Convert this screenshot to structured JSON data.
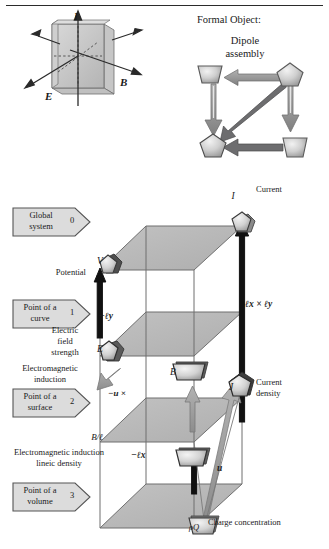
{
  "page": {
    "width": 329,
    "height": 549,
    "background": "#ffffff",
    "rule_color": "#2b2b2b"
  },
  "palette": {
    "plane_fill": "#b9b9b9",
    "plane_edge": "#6e6e6e",
    "node_light": "#d8d8d8",
    "node_mid": "#a8a8a8",
    "node_dark": "#3a3a3a",
    "arrow_gray": "#8f8f8f",
    "arrow_dark": "#58585a",
    "arrow_black": "#111111",
    "tag_fill": "#dcdcdc",
    "tag_edge": "#555555",
    "text": "#1a1a1a"
  },
  "top_left_figure": {
    "name": "em-slab-axes",
    "axis_labels": [
      {
        "id": "I",
        "text": "I",
        "role": "current-axis"
      },
      {
        "id": "E",
        "text": "E",
        "role": "electric-field-axis"
      },
      {
        "id": "B",
        "text": "B",
        "role": "magnetic-field-axis"
      }
    ]
  },
  "top_right_figure": {
    "heading": "Formal Object:",
    "title_line1": "Dipole",
    "title_line2": "assembly",
    "nodes": [
      {
        "id": "tl",
        "shape": "trapezoid",
        "label": ""
      },
      {
        "id": "tr",
        "shape": "pentagon",
        "label": ""
      },
      {
        "id": "bl",
        "shape": "pentagon",
        "label": ""
      },
      {
        "id": "br",
        "shape": "trapezoid",
        "label": ""
      }
    ],
    "arrows": [
      {
        "from": "tr",
        "to": "tl",
        "style": "thick-gray",
        "direction": "left"
      },
      {
        "from": "tl",
        "to": "bl",
        "style": "hollow-gray",
        "direction": "down"
      },
      {
        "from": "tr",
        "to": "br",
        "style": "hollow-gray",
        "direction": "down"
      },
      {
        "from": "tr",
        "to": "bl",
        "style": "thick-dark",
        "direction": "diagonal"
      },
      {
        "from": "br",
        "to": "bl",
        "style": "thick-dark",
        "direction": "left"
      }
    ]
  },
  "level_tags": [
    {
      "line1": "Global",
      "line2": "system",
      "number": "0"
    },
    {
      "line1": "Point of a",
      "line2": "curve",
      "number": "1"
    },
    {
      "line1": "Point of a",
      "line2": "surface",
      "number": "2"
    },
    {
      "line1": "Point of a",
      "line2": "volume",
      "number": "3"
    }
  ],
  "left_captions": [
    {
      "id": "potential",
      "lines": [
        "Potential"
      ]
    },
    {
      "id": "efield",
      "lines": [
        "Electric",
        "field",
        "strength"
      ]
    },
    {
      "id": "eminduction",
      "lines": [
        "Electromagnetic",
        "induction"
      ]
    },
    {
      "id": "emlineic",
      "lines": [
        "Electromagnetic induction",
        "lineic density"
      ]
    }
  ],
  "right_captions": [
    {
      "id": "current",
      "lines": [
        "Current"
      ]
    },
    {
      "id": "current-density",
      "lines": [
        "Current",
        "density"
      ]
    },
    {
      "id": "charge-conc",
      "lines": [
        "Charge concentration"
      ]
    }
  ],
  "lattice": {
    "planes": 4,
    "nodes": [
      {
        "id": "V",
        "symbol": "V",
        "shape": "pentagon",
        "level": 0,
        "side": "left"
      },
      {
        "id": "I",
        "symbol": "I",
        "shape": "pentagon",
        "level": 0,
        "side": "right"
      },
      {
        "id": "E",
        "symbol": "E",
        "shape": "pentagon",
        "level": 1,
        "side": "left"
      },
      {
        "id": "B",
        "symbol": "B",
        "shape": "trapezoid",
        "level": 2,
        "side": "mid"
      },
      {
        "id": "J",
        "symbol": "J",
        "shape": "pentagon",
        "level": 2,
        "side": "right"
      },
      {
        "id": "Bl",
        "symbol": "B/ℓ",
        "shape": "trapezoid",
        "level": 3,
        "side": "left"
      },
      {
        "id": "rhoQ",
        "symbol": "ρQ",
        "shape": "trapezoid",
        "level": 3,
        "side": "right"
      }
    ],
    "edge_labels": [
      {
        "id": "lxly",
        "text": "ℓx × ℓy",
        "near": "I"
      },
      {
        "id": "negly",
        "text": "−ℓy",
        "near": "V-E"
      },
      {
        "id": "negux",
        "text": "−u ×",
        "near": "E-B"
      },
      {
        "id": "neglx",
        "text": "−ℓx",
        "near": "B-Bl"
      },
      {
        "id": "u",
        "text": "u",
        "near": "J-rhoQ"
      }
    ]
  }
}
